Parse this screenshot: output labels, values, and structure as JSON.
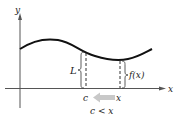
{
  "diagram": {
    "type": "limit-from-right-illustration",
    "axes": {
      "x_label": "x",
      "y_label": "y"
    },
    "labels": {
      "limit": "L",
      "function_value": "f(x)",
      "c_point": "c",
      "x_point": "x",
      "condition": "c < x"
    },
    "colors": {
      "curve": "#111111",
      "axis": "#555555",
      "arrow": "#c8c8c8",
      "dashed": "#333333"
    }
  }
}
